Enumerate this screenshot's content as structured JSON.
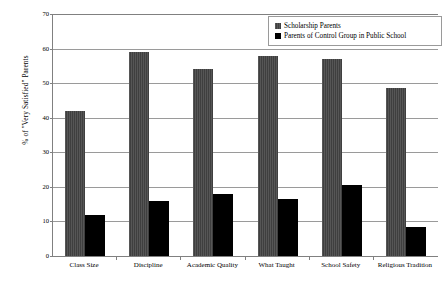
{
  "chart_data": {
    "type": "bar",
    "title": "",
    "xlabel": "",
    "ylabel": "% of \"Very Satisfied\" Parents",
    "ylim": [
      0,
      70
    ],
    "ytick_step": 10,
    "yticks": [
      0,
      10,
      20,
      30,
      40,
      50,
      60,
      70
    ],
    "grid": true,
    "legend_position": "top-right",
    "categories": [
      "Class Size",
      "Discipline",
      "Academic Quality",
      "What Taught",
      "School Safety",
      "Religious Tradition"
    ],
    "series": [
      {
        "name": "Scholarship Parents",
        "color": "#4a4a4a",
        "values": [
          42,
          59,
          54,
          58,
          57,
          48.5
        ]
      },
      {
        "name": "Parents of Control Group in Public School",
        "color": "#000000",
        "values": [
          12,
          16,
          18,
          16.5,
          20.5,
          8.5
        ]
      }
    ]
  },
  "legend": {
    "items": [
      {
        "label": "Scholarship Parents",
        "swatch": "legend-swatch-gray"
      },
      {
        "label": "Parents of Control Group in Public School",
        "swatch": "legend-swatch-black"
      }
    ]
  },
  "axis": {
    "y_title": "% of \"Very Satisfied\" Parents",
    "tick_labels": [
      "0",
      "10",
      "20",
      "30",
      "40",
      "50",
      "60",
      "70"
    ]
  }
}
